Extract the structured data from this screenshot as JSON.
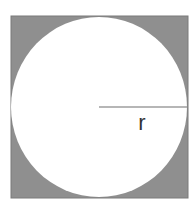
{
  "diagram": {
    "type": "circle-inscribed-in-square",
    "square": {
      "x": 11,
      "y": 16,
      "width": 177,
      "height": 182,
      "fill": "#8f8f8f",
      "stroke": "#7a7a7a"
    },
    "circle": {
      "cx": 99,
      "cy": 107,
      "rx": 88,
      "ry": 90,
      "fill": "#ffffff"
    },
    "radius_line": {
      "x1": 99,
      "y1": 107,
      "x2": 187,
      "y2": 107,
      "stroke": "#6f6f6f"
    },
    "radius_label": {
      "text": "r",
      "x": 142,
      "y": 130,
      "color": "#333333"
    }
  }
}
